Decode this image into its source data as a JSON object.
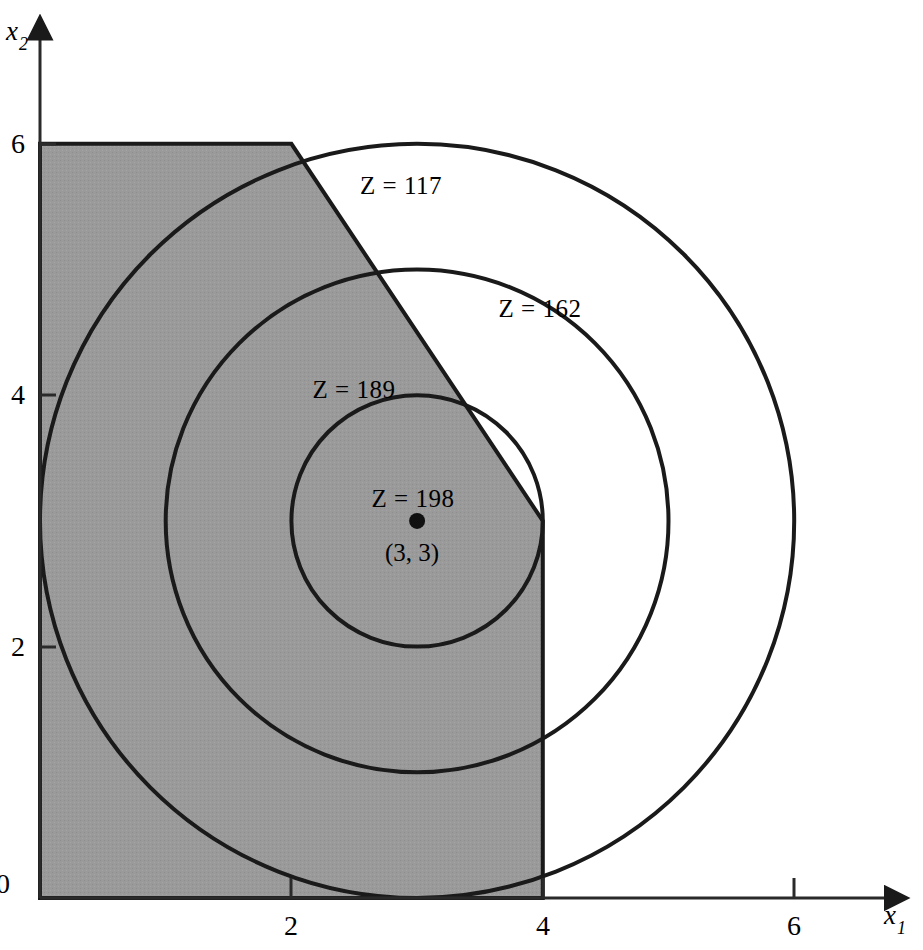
{
  "figure": {
    "kind": "graphical-solution-plot",
    "background_color": "#ffffff",
    "line_color": "#1a1a1a",
    "feasible_region_fill": "#9a9a9a"
  },
  "axes": {
    "x": {
      "label": "x",
      "subscript": "1",
      "ticks": [
        {
          "value": 2,
          "text": "2"
        },
        {
          "value": 4,
          "text": "4"
        },
        {
          "value": 6,
          "text": "6"
        }
      ],
      "origin_text": "0",
      "range": [
        0,
        6.9
      ]
    },
    "y": {
      "label": "x",
      "subscript": "2",
      "ticks": [
        {
          "value": 2,
          "text": "2"
        },
        {
          "value": 4,
          "text": "4"
        },
        {
          "value": 6,
          "text": "6"
        }
      ],
      "range": [
        0,
        7.0
      ]
    }
  },
  "chart_data": {
    "type": "line",
    "title": "",
    "xlabel": "x1",
    "ylabel": "x2",
    "xlim": [
      0,
      6.9
    ],
    "ylim": [
      0,
      7.0
    ],
    "grid": false,
    "legend": "none",
    "feasible_region": {
      "name": "feasible-region",
      "fill": "#9a9a9a",
      "vertices": [
        [
          0,
          0
        ],
        [
          4,
          0
        ],
        [
          4,
          3
        ],
        [
          2,
          6
        ],
        [
          0,
          6
        ]
      ]
    },
    "contours": [
      {
        "label": "Z = 117",
        "z": 117,
        "center": [
          3,
          3
        ],
        "radius": 3,
        "label_pos": [
          2.87,
          5.72
        ]
      },
      {
        "label": "Z = 162",
        "z": 162,
        "center": [
          3,
          3
        ],
        "radius": 2,
        "label_pos": [
          3.97,
          4.74
        ]
      },
      {
        "label": "Z = 189",
        "z": 189,
        "center": [
          3,
          3
        ],
        "radius": 1,
        "label_pos": [
          2.5,
          4.05
        ]
      },
      {
        "label": "Z = 198",
        "z": 198,
        "center": [
          3,
          3
        ],
        "radius": 0,
        "label_pos": [
          2.97,
          3.18
        ]
      }
    ],
    "optimal_point": {
      "coords": [
        3,
        3
      ],
      "coord_text": "(3, 3)",
      "z_text": "Z = 198",
      "marker": "filled-circle"
    }
  },
  "labels": {
    "z117": "Z = 117",
    "z162": "Z = 162",
    "z189": "Z = 189",
    "z198": "Z = 198",
    "optimum_coords": "(3, 3)",
    "x_axis": "x",
    "x_axis_sub": "1",
    "y_axis": "x",
    "y_axis_sub": "2",
    "origin": "0",
    "x_tick_2": "2",
    "x_tick_4": "4",
    "x_tick_6": "6",
    "y_tick_2": "2",
    "y_tick_4": "4",
    "y_tick_6": "6"
  }
}
